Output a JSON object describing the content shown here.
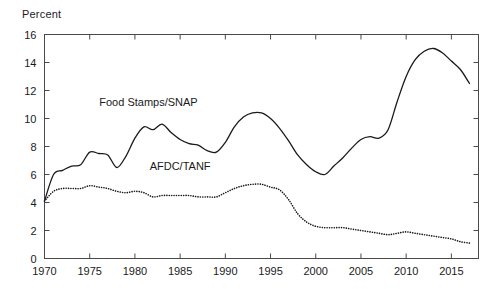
{
  "chart_data": {
    "type": "line",
    "title": "",
    "subtitle": "",
    "ylabel": "Percent",
    "xlabel": "",
    "xlim": [
      1970,
      2018
    ],
    "ylim": [
      0,
      16
    ],
    "yticks": [
      0,
      2,
      4,
      6,
      8,
      10,
      12,
      14,
      16
    ],
    "xticks": [
      1970,
      1975,
      1980,
      1985,
      1990,
      1995,
      2000,
      2005,
      2010,
      2015
    ],
    "ytick_labels": [
      "0",
      "2",
      "4",
      "6",
      "8",
      "10",
      "12",
      "14",
      "16"
    ],
    "xtick_labels": [
      "1970",
      "1975",
      "1980",
      "1985",
      "1990",
      "1995",
      "2000",
      "2005",
      "2010",
      "2015"
    ],
    "grid": false,
    "legend_position": "inline-annotation",
    "x": [
      1970,
      1971,
      1972,
      1973,
      1974,
      1975,
      1976,
      1977,
      1978,
      1979,
      1980,
      1981,
      1982,
      1983,
      1984,
      1985,
      1986,
      1987,
      1988,
      1989,
      1990,
      1991,
      1992,
      1993,
      1994,
      1995,
      1996,
      1997,
      1998,
      1999,
      2000,
      2001,
      2002,
      2003,
      2004,
      2005,
      2006,
      2007,
      2008,
      2009,
      2010,
      2011,
      2012,
      2013,
      2014,
      2015,
      2016,
      2017
    ],
    "series": [
      {
        "name": "Food Stamps/SNAP",
        "style": "solid",
        "color": "#1a1a1a",
        "label_x": 1981.5,
        "label_y": 10.9,
        "values": [
          4.1,
          6.0,
          6.3,
          6.6,
          6.7,
          7.6,
          7.5,
          7.4,
          6.5,
          7.3,
          8.6,
          9.4,
          9.2,
          9.6,
          9.0,
          8.5,
          8.2,
          8.1,
          7.7,
          7.6,
          8.3,
          9.4,
          10.1,
          10.4,
          10.4,
          10.0,
          9.3,
          8.4,
          7.4,
          6.7,
          6.2,
          6.0,
          6.6,
          7.2,
          7.9,
          8.5,
          8.7,
          8.6,
          9.2,
          11.2,
          13.0,
          14.2,
          14.8,
          15.0,
          14.7,
          14.1,
          13.5,
          12.5
        ]
      },
      {
        "name": "AFDC/TANF",
        "style": "dotted",
        "color": "#1a1a1a",
        "label_x": 1985.0,
        "label_y": 6.3,
        "values": [
          4.1,
          4.8,
          5.0,
          5.0,
          5.0,
          5.2,
          5.1,
          5.0,
          4.8,
          4.7,
          4.8,
          4.7,
          4.4,
          4.5,
          4.5,
          4.5,
          4.5,
          4.4,
          4.4,
          4.4,
          4.7,
          5.0,
          5.2,
          5.3,
          5.3,
          5.1,
          4.9,
          4.2,
          3.2,
          2.6,
          2.3,
          2.2,
          2.2,
          2.2,
          2.1,
          2.0,
          1.9,
          1.8,
          1.7,
          1.8,
          1.9,
          1.8,
          1.7,
          1.6,
          1.5,
          1.4,
          1.2,
          1.1
        ]
      }
    ]
  }
}
